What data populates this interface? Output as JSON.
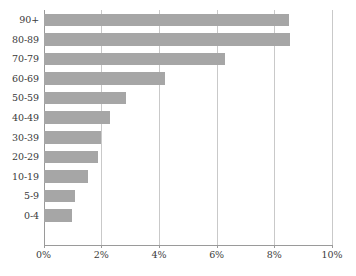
{
  "chart_data": {
    "type": "bar",
    "orientation": "horizontal",
    "title": "",
    "subtitle": "",
    "xlabel": "",
    "ylabel": "",
    "categories": [
      "90+",
      "80-89",
      "70-79",
      "60-69",
      "50-59",
      "40-49",
      "30-39",
      "20-29",
      "10-19",
      "5-9",
      "0-4"
    ],
    "values": [
      8.5,
      8.55,
      6.3,
      4.2,
      2.85,
      2.3,
      2.0,
      1.9,
      1.55,
      1.1,
      1.0
    ],
    "value_suffix": "%",
    "xlim": [
      0,
      10
    ],
    "xticks": [
      0,
      2,
      4,
      6,
      8,
      10
    ],
    "xtick_labels": [
      "0%",
      "2%",
      "4%",
      "6%",
      "8%",
      "10%"
    ],
    "grid": "vertical",
    "legend": "none",
    "bar_color": "#a6a6a6",
    "gridline_color": "#c9c9c9",
    "axis_color": "#9a9a9a",
    "text_color": "#3a3a3a"
  }
}
